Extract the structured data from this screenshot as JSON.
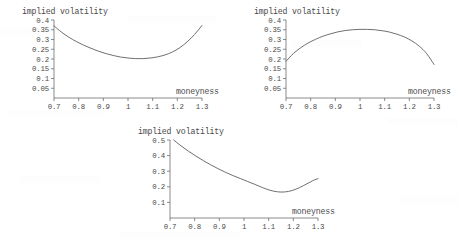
{
  "page": {
    "background": "#ffffff",
    "curve_color": "#555555",
    "axis_color": "#5a5a5a",
    "text_color": "#4a4a4a"
  },
  "chart_data": [
    {
      "type": "line",
      "name": "volatility-smile",
      "title": "implied volatility",
      "xlabel": "moneyness",
      "ylabel": "implied volatility",
      "xlim": [
        0.7,
        1.3
      ],
      "ylim": [
        0.0,
        0.4
      ],
      "grid": false,
      "legend": "none",
      "xticks": [
        "0.7",
        "0.8",
        "0.9",
        "1",
        "1.1",
        "1.2",
        "1.3"
      ],
      "xtick_values": [
        0.7,
        0.8,
        0.9,
        1.0,
        1.1,
        1.2,
        1.3
      ],
      "yticks": [
        "0.05",
        "0.1",
        "0.15",
        "0.2",
        "0.25",
        "0.3",
        "0.35",
        "0.4"
      ],
      "ytick_values": [
        0.05,
        0.1,
        0.15,
        0.2,
        0.25,
        0.3,
        0.35,
        0.4
      ],
      "x": [
        0.7,
        0.73,
        0.76,
        0.79,
        0.82,
        0.85,
        0.88,
        0.91,
        0.94,
        0.97,
        1.0,
        1.03,
        1.06,
        1.09,
        1.12,
        1.15,
        1.18,
        1.21,
        1.24,
        1.27,
        1.3
      ],
      "values": [
        0.37,
        0.338,
        0.312,
        0.29,
        0.271,
        0.255,
        0.24,
        0.228,
        0.218,
        0.21,
        0.205,
        0.202,
        0.202,
        0.205,
        0.211,
        0.221,
        0.236,
        0.258,
        0.288,
        0.326,
        0.372
      ]
    },
    {
      "type": "line",
      "name": "volatility-frown",
      "title": "implied volatility",
      "xlabel": "moneyness",
      "ylabel": "implied volatility",
      "xlim": [
        0.7,
        1.3
      ],
      "ylim": [
        0.0,
        0.4
      ],
      "grid": false,
      "legend": "none",
      "xticks": [
        "0.7",
        "0.8",
        "0.9",
        "1",
        "1.1",
        "1.2",
        "1.3"
      ],
      "xtick_values": [
        0.7,
        0.8,
        0.9,
        1.0,
        1.1,
        1.2,
        1.3
      ],
      "yticks": [
        "0.05",
        "0.1",
        "0.15",
        "0.2",
        "0.25",
        "0.3",
        "0.35",
        "0.4"
      ],
      "ytick_values": [
        0.05,
        0.1,
        0.15,
        0.2,
        0.25,
        0.3,
        0.35,
        0.4
      ],
      "x": [
        0.7,
        0.73,
        0.76,
        0.79,
        0.82,
        0.85,
        0.88,
        0.91,
        0.94,
        0.97,
        1.0,
        1.03,
        1.06,
        1.09,
        1.12,
        1.15,
        1.18,
        1.21,
        1.24,
        1.27,
        1.3
      ],
      "values": [
        0.188,
        0.228,
        0.258,
        0.282,
        0.301,
        0.317,
        0.329,
        0.339,
        0.346,
        0.35,
        0.352,
        0.352,
        0.35,
        0.345,
        0.338,
        0.327,
        0.313,
        0.293,
        0.266,
        0.228,
        0.172
      ]
    },
    {
      "type": "line",
      "name": "volatility-skew",
      "title": "implied volatility",
      "xlabel": "moneyness",
      "ylabel": "implied volatility",
      "xlim": [
        0.7,
        1.3
      ],
      "ylim": [
        0.0,
        0.5
      ],
      "grid": false,
      "legend": "none",
      "xticks": [
        "0.7",
        "0.8",
        "0.9",
        "1",
        "1.1",
        "1.2",
        "1.3"
      ],
      "xtick_values": [
        0.7,
        0.8,
        0.9,
        1.0,
        1.1,
        1.2,
        1.3
      ],
      "yticks": [
        "0.1",
        "0.2",
        "0.3",
        "0.4",
        "0.5"
      ],
      "ytick_values": [
        0.1,
        0.2,
        0.3,
        0.4,
        0.5
      ],
      "x": [
        0.715,
        0.745,
        0.775,
        0.805,
        0.835,
        0.865,
        0.895,
        0.925,
        0.955,
        0.985,
        1.015,
        1.045,
        1.075,
        1.105,
        1.135,
        1.165,
        1.195,
        1.225,
        1.255,
        1.285,
        1.3
      ],
      "values": [
        0.5,
        0.462,
        0.428,
        0.397,
        0.368,
        0.341,
        0.316,
        0.293,
        0.272,
        0.253,
        0.234,
        0.215,
        0.195,
        0.178,
        0.168,
        0.167,
        0.176,
        0.195,
        0.219,
        0.244,
        0.252
      ]
    }
  ]
}
